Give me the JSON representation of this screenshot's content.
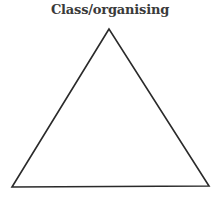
{
  "diagram": {
    "title": "Class/organising",
    "shape": "triangle",
    "vertices": {
      "apex": [
        109,
        29
      ],
      "bottom_left": [
        12,
        187
      ],
      "bottom_right": [
        209,
        186
      ]
    },
    "stroke_color": "#2a2a2a",
    "fill_color": "#ffffff"
  }
}
